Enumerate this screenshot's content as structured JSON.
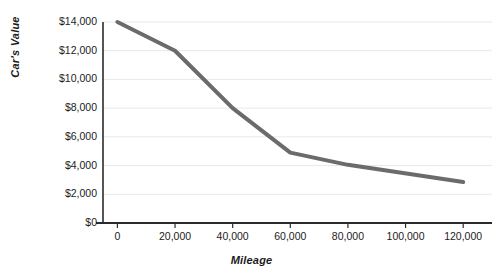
{
  "chart_data": {
    "type": "line",
    "title": "",
    "subtitle": "",
    "xlabel": "Mileage",
    "ylabel": "Car's Value",
    "x": [
      0,
      20000,
      40000,
      60000,
      80000,
      120000
    ],
    "values": [
      14000,
      12000,
      8000,
      4900,
      4050,
      2850
    ],
    "series": [
      {
        "name": "Car's Value",
        "values": [
          14000,
          12000,
          8000,
          4900,
          4050,
          2850
        ]
      }
    ],
    "xlim": [
      -5000,
      130000
    ],
    "ylim": [
      0,
      14000
    ],
    "xticks": [
      0,
      20000,
      40000,
      60000,
      80000,
      100000,
      120000
    ],
    "yticks": [
      0,
      2000,
      4000,
      6000,
      8000,
      10000,
      12000,
      14000
    ],
    "xtick_labels": [
      "0",
      "20,000",
      "40,000",
      "60,000",
      "80,000",
      "100,000",
      "120,000"
    ],
    "ytick_labels": [
      "$0",
      "$2,000",
      "$4,000",
      "$6,000",
      "$8,000",
      "$10,000",
      "$12,000",
      "$14,000"
    ],
    "grid": "horizontal",
    "legend": "none",
    "annotations": [],
    "colors": {
      "line": "#6b6b6b",
      "gridline": "#e8e8e8",
      "axis": "#2b2b2b",
      "text": "#1c1c1c",
      "background": "#ffffff"
    },
    "line_width": 4
  }
}
